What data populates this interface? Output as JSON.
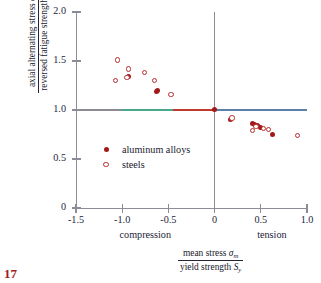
{
  "chart_data": {
    "type": "scatter",
    "title": "",
    "xlabel": "mean stress σm / yield strength Sy",
    "ylabel": "axial alternating stress σa / reversed fatigue strength Sf",
    "xlim": [
      -1.5,
      1.0
    ],
    "ylim": [
      0,
      2.0
    ],
    "xticks": [
      "-1.5",
      "-1.0",
      "-0.5",
      "0",
      "0.5",
      "1.0"
    ],
    "xtick_values": [
      -1.5,
      -1.0,
      -0.5,
      0,
      0.5,
      1.0
    ],
    "yticks": [
      "0",
      "0.5",
      "1.0",
      "1.5",
      "2.0"
    ],
    "ytick_values": [
      0,
      0.5,
      1.0,
      1.5,
      2.0
    ],
    "grid": false,
    "legend_position": "inner-left",
    "reference_lines": [
      {
        "name": "horizontal-unity-line",
        "orientation": "horizontal",
        "value": 1.0
      },
      {
        "name": "vertical-zero-line",
        "orientation": "vertical",
        "value": 0
      }
    ],
    "zone_labels": [
      {
        "label": "compression",
        "x": -0.75
      },
      {
        "label": "tension",
        "x": 0.62
      }
    ],
    "series": [
      {
        "name": "aluminum alloys",
        "marker": "filled-circle",
        "color": "#a31919",
        "points": [
          [
            -0.93,
            1.34
          ],
          [
            -0.62,
            1.2
          ],
          [
            -0.63,
            1.19
          ],
          [
            0.0,
            1.01
          ],
          [
            0.17,
            0.9
          ],
          [
            0.41,
            0.86
          ],
          [
            0.43,
            0.85
          ],
          [
            0.46,
            0.84
          ],
          [
            0.5,
            0.82
          ],
          [
            0.63,
            0.75
          ]
        ]
      },
      {
        "name": "steels",
        "marker": "open-circle",
        "color": "#bc2b2b",
        "points": [
          [
            -1.05,
            1.51
          ],
          [
            -1.07,
            1.3
          ],
          [
            -0.95,
            1.33
          ],
          [
            -0.93,
            1.42
          ],
          [
            -0.76,
            1.38
          ],
          [
            -0.65,
            1.3
          ],
          [
            -0.47,
            1.16
          ],
          [
            0.19,
            0.92
          ],
          [
            0.41,
            0.79
          ],
          [
            0.45,
            0.83
          ],
          [
            0.53,
            0.81
          ],
          [
            0.58,
            0.8
          ],
          [
            0.9,
            0.74
          ]
        ]
      }
    ]
  },
  "labels": {
    "y_axis_numerator": "axial alternating stress",
    "y_axis_num_symbol": "σ",
    "y_axis_num_sub": "a",
    "y_axis_denominator": "reversed fatigue strength",
    "y_axis_den_symbol": "S",
    "y_axis_den_sub": "f",
    "x_axis_numerator": "mean stress",
    "x_axis_num_symbol": "σ",
    "x_axis_num_sub": "m",
    "x_axis_denominator": "yield strength",
    "x_axis_den_symbol": "S",
    "x_axis_den_sub": "y",
    "compression": "compression",
    "tension": "tension"
  },
  "legend": {
    "items": [
      {
        "label": "aluminum alloys",
        "marker": "filled-circle"
      },
      {
        "label": "steels",
        "marker": "open-circle"
      }
    ]
  },
  "figure_number": "17"
}
